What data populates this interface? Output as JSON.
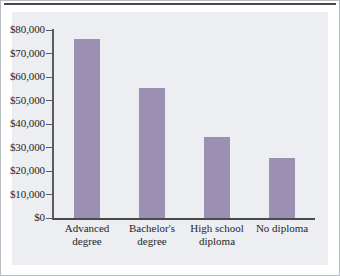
{
  "chart_data": {
    "type": "bar",
    "title": "",
    "subtitle": "",
    "xlabel": "",
    "ylabel": "",
    "categories": [
      "Advanced\ndegree",
      "Bachelor's\ndegree",
      "High school\ndiploma",
      "No diploma"
    ],
    "values": [
      76000,
      55300,
      34500,
      25500
    ],
    "ylim": [
      0,
      80000
    ],
    "y_ticks": [
      0,
      10000,
      20000,
      30000,
      40000,
      50000,
      60000,
      70000,
      80000
    ],
    "y_tick_labels": [
      "$0",
      "$10,000",
      "$20,000",
      "$30,000",
      "$40,000",
      "$50,000",
      "$60,000",
      "$70,000",
      "$80,000"
    ],
    "grid": false,
    "legend": null,
    "bar_color": "#9b8fb4",
    "panel_color": "#eceef1",
    "axis_color": "#4a4a4c"
  }
}
